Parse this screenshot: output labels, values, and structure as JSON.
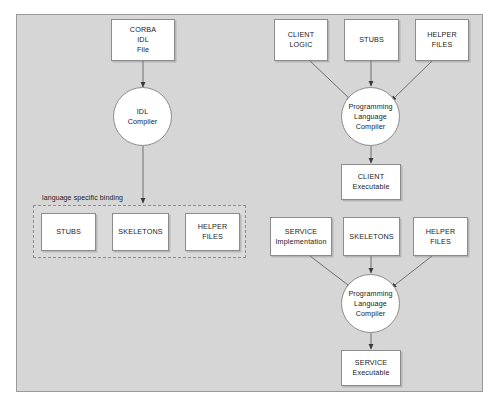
{
  "diagram": {
    "canvas": {
      "background_color": "#d6d6d6",
      "border_color": "#9a9a9a"
    },
    "binding_group": {
      "label": "language specific binding",
      "style": "dashed"
    },
    "nodes": [
      {
        "id": "corba-idl-file",
        "shape": "rect",
        "lines": [
          "CORBA",
          "IDL",
          "File"
        ]
      },
      {
        "id": "idl-compiler",
        "shape": "circle",
        "lines": [
          "IDL",
          "Compiler"
        ]
      },
      {
        "id": "binding-stubs",
        "shape": "rect",
        "lines": [
          "STUBS"
        ]
      },
      {
        "id": "binding-skeletons",
        "shape": "rect",
        "lines": [
          "SKELETONS"
        ]
      },
      {
        "id": "binding-helper-files",
        "shape": "rect",
        "lines": [
          "HELPER",
          "FILES"
        ]
      },
      {
        "id": "client-logic",
        "shape": "rect",
        "lines": [
          "CLIENT",
          "LOGIC"
        ]
      },
      {
        "id": "client-stubs",
        "shape": "rect",
        "lines": [
          "STUBS"
        ]
      },
      {
        "id": "client-helper-files",
        "shape": "rect",
        "lines": [
          "HELPER",
          "FILES"
        ]
      },
      {
        "id": "client-compiler",
        "shape": "circle",
        "lines": [
          "Programming",
          "Language",
          "Compiler"
        ]
      },
      {
        "id": "client-executable",
        "shape": "rect",
        "lines": [
          "CLIENT",
          "Executable"
        ]
      },
      {
        "id": "service-implementation",
        "shape": "rect",
        "lines": [
          "SERVICE",
          "Implementation"
        ]
      },
      {
        "id": "service-skeletons",
        "shape": "rect",
        "lines": [
          "SKELETONS"
        ]
      },
      {
        "id": "service-helper-files",
        "shape": "rect",
        "lines": [
          "HELPER",
          "FILES"
        ]
      },
      {
        "id": "service-compiler",
        "shape": "circle",
        "lines": [
          "Programming",
          "Language",
          "Compiler"
        ]
      },
      {
        "id": "service-executable",
        "shape": "rect",
        "lines": [
          "SERVICE",
          "Executable"
        ]
      }
    ],
    "edges": [
      {
        "from": "corba-idl-file",
        "to": "idl-compiler"
      },
      {
        "from": "idl-compiler",
        "to": "binding-group"
      },
      {
        "from": "client-logic",
        "to": "client-compiler"
      },
      {
        "from": "client-stubs",
        "to": "client-compiler"
      },
      {
        "from": "client-helper-files",
        "to": "client-compiler"
      },
      {
        "from": "client-compiler",
        "to": "client-executable"
      },
      {
        "from": "service-implementation",
        "to": "service-compiler"
      },
      {
        "from": "service-skeletons",
        "to": "service-compiler"
      },
      {
        "from": "service-helper-files",
        "to": "service-compiler"
      },
      {
        "from": "service-compiler",
        "to": "service-executable"
      }
    ]
  }
}
